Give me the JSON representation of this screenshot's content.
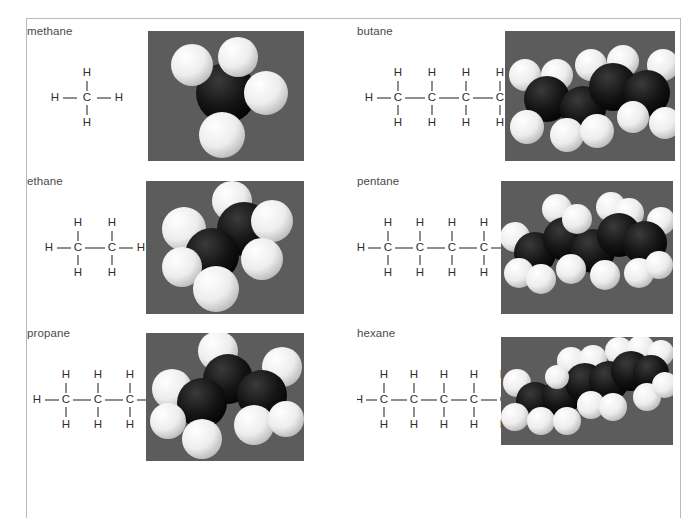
{
  "figure": {
    "background_color": "#ffffff",
    "border_color": "#b9b9bb",
    "label_color": "#4a4a4a",
    "bond_color": "#3a3a3a",
    "atom_label_color": "#2e2e2e",
    "photo_background_color": "#585858",
    "carbon_color": "#111111",
    "hydrogen_color": "#f2f2f2"
  },
  "molecules": [
    {
      "name": "methane",
      "carbon_count": 1,
      "hydrogen_count": 4,
      "formula": "CH4",
      "atom_labels": {
        "carbon": "C",
        "hydrogen": "H"
      },
      "model_caption": "methane space-filling model",
      "model": {
        "background": "#585858",
        "carbons": [
          {
            "x": 78,
            "y": 62,
            "r": 30
          }
        ],
        "hydrogens": [
          {
            "x": 44,
            "y": 34,
            "r": 21
          },
          {
            "x": 90,
            "y": 26,
            "r": 20
          },
          {
            "x": 118,
            "y": 62,
            "r": 22
          },
          {
            "x": 74,
            "y": 104,
            "r": 23
          }
        ]
      }
    },
    {
      "name": "butane",
      "carbon_count": 4,
      "hydrogen_count": 10,
      "formula": "C4H10",
      "atom_labels": {
        "carbon": "C",
        "hydrogen": "H"
      },
      "model_caption": "butane space-filling model",
      "model": {
        "background": "#585858",
        "carbons": [
          {
            "x": 42,
            "y": 68,
            "r": 23
          },
          {
            "x": 78,
            "y": 78,
            "r": 23
          },
          {
            "x": 108,
            "y": 56,
            "r": 24
          },
          {
            "x": 142,
            "y": 62,
            "r": 23
          }
        ],
        "hydrogens": [
          {
            "x": 20,
            "y": 44,
            "r": 16
          },
          {
            "x": 52,
            "y": 44,
            "r": 16
          },
          {
            "x": 22,
            "y": 96,
            "r": 17
          },
          {
            "x": 62,
            "y": 104,
            "r": 17
          },
          {
            "x": 92,
            "y": 100,
            "r": 17
          },
          {
            "x": 86,
            "y": 34,
            "r": 16
          },
          {
            "x": 118,
            "y": 30,
            "r": 16
          },
          {
            "x": 128,
            "y": 86,
            "r": 16
          },
          {
            "x": 158,
            "y": 34,
            "r": 16
          },
          {
            "x": 160,
            "y": 92,
            "r": 16
          }
        ]
      }
    },
    {
      "name": "ethane",
      "carbon_count": 2,
      "hydrogen_count": 6,
      "formula": "C2H6",
      "atom_labels": {
        "carbon": "C",
        "hydrogen": "H"
      },
      "model_caption": "ethane space-filling model",
      "model": {
        "background": "#585858",
        "carbons": [
          {
            "x": 66,
            "y": 74,
            "r": 27
          },
          {
            "x": 98,
            "y": 48,
            "r": 27
          }
        ],
        "hydrogens": [
          {
            "x": 38,
            "y": 48,
            "r": 22
          },
          {
            "x": 36,
            "y": 86,
            "r": 20
          },
          {
            "x": 70,
            "y": 108,
            "r": 23
          },
          {
            "x": 86,
            "y": 20,
            "r": 20
          },
          {
            "x": 126,
            "y": 40,
            "r": 21
          },
          {
            "x": 116,
            "y": 78,
            "r": 21
          }
        ]
      }
    },
    {
      "name": "pentane",
      "carbon_count": 5,
      "hydrogen_count": 12,
      "formula": "C5H12",
      "atom_labels": {
        "carbon": "C",
        "hydrogen": "H"
      },
      "model_caption": "pentane space-filling model",
      "model": {
        "background": "#585858",
        "carbons": [
          {
            "x": 34,
            "y": 72,
            "r": 21
          },
          {
            "x": 64,
            "y": 58,
            "r": 22
          },
          {
            "x": 92,
            "y": 70,
            "r": 22
          },
          {
            "x": 118,
            "y": 54,
            "r": 22
          },
          {
            "x": 144,
            "y": 62,
            "r": 22
          }
        ],
        "hydrogens": [
          {
            "x": 14,
            "y": 56,
            "r": 15
          },
          {
            "x": 18,
            "y": 92,
            "r": 15
          },
          {
            "x": 40,
            "y": 98,
            "r": 15
          },
          {
            "x": 56,
            "y": 28,
            "r": 15
          },
          {
            "x": 76,
            "y": 38,
            "r": 15
          },
          {
            "x": 70,
            "y": 88,
            "r": 15
          },
          {
            "x": 104,
            "y": 94,
            "r": 15
          },
          {
            "x": 110,
            "y": 26,
            "r": 15
          },
          {
            "x": 128,
            "y": 32,
            "r": 15
          },
          {
            "x": 138,
            "y": 92,
            "r": 15
          },
          {
            "x": 160,
            "y": 40,
            "r": 14
          },
          {
            "x": 158,
            "y": 84,
            "r": 14
          }
        ]
      }
    },
    {
      "name": "propane",
      "carbon_count": 3,
      "hydrogen_count": 8,
      "formula": "C3H8",
      "atom_labels": {
        "carbon": "C",
        "hydrogen": "H"
      },
      "model_caption": "propane space-filling model",
      "model": {
        "background": "#585858",
        "carbons": [
          {
            "x": 56,
            "y": 70,
            "r": 25
          },
          {
            "x": 82,
            "y": 46,
            "r": 25
          },
          {
            "x": 116,
            "y": 62,
            "r": 25
          }
        ],
        "hydrogens": [
          {
            "x": 26,
            "y": 56,
            "r": 20
          },
          {
            "x": 22,
            "y": 88,
            "r": 18
          },
          {
            "x": 56,
            "y": 106,
            "r": 20
          },
          {
            "x": 72,
            "y": 18,
            "r": 20
          },
          {
            "x": 136,
            "y": 34,
            "r": 20
          },
          {
            "x": 108,
            "y": 92,
            "r": 20
          },
          {
            "x": 140,
            "y": 86,
            "r": 18
          },
          {
            "x": 92,
            "y": 74,
            "r": 15
          }
        ]
      }
    },
    {
      "name": "hexane",
      "carbon_count": 6,
      "hydrogen_count": 14,
      "formula": "C6H14",
      "atom_labels": {
        "carbon": "C",
        "hydrogen": "H"
      },
      "model_caption": "hexane space-filling model",
      "model": {
        "background": "#585858",
        "carbons": [
          {
            "x": 34,
            "y": 64,
            "r": 19
          },
          {
            "x": 60,
            "y": 60,
            "r": 19
          },
          {
            "x": 84,
            "y": 46,
            "r": 20
          },
          {
            "x": 108,
            "y": 44,
            "r": 20
          },
          {
            "x": 130,
            "y": 34,
            "r": 20
          },
          {
            "x": 150,
            "y": 36,
            "r": 18
          }
        ],
        "hydrogens": [
          {
            "x": 16,
            "y": 46,
            "r": 14
          },
          {
            "x": 14,
            "y": 80,
            "r": 14
          },
          {
            "x": 40,
            "y": 84,
            "r": 14
          },
          {
            "x": 66,
            "y": 84,
            "r": 14
          },
          {
            "x": 70,
            "y": 24,
            "r": 14
          },
          {
            "x": 92,
            "y": 22,
            "r": 14
          },
          {
            "x": 90,
            "y": 68,
            "r": 14
          },
          {
            "x": 112,
            "y": 70,
            "r": 14
          },
          {
            "x": 118,
            "y": 14,
            "r": 14
          },
          {
            "x": 140,
            "y": 12,
            "r": 14
          },
          {
            "x": 146,
            "y": 60,
            "r": 14
          },
          {
            "x": 160,
            "y": 16,
            "r": 13
          },
          {
            "x": 164,
            "y": 48,
            "r": 13
          },
          {
            "x": 56,
            "y": 40,
            "r": 12
          }
        ]
      }
    }
  ]
}
